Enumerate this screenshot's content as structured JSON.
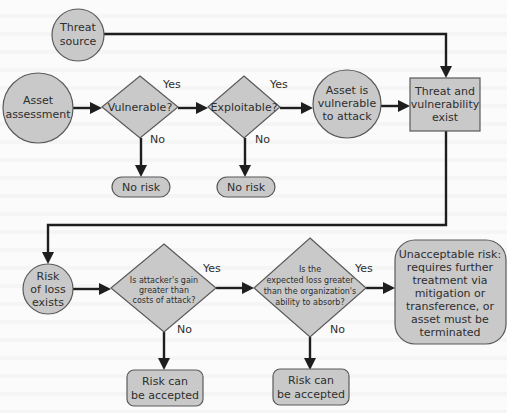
{
  "diagram": {
    "type": "flowchart",
    "nodes": {
      "threat_source": {
        "shape": "circle",
        "lines": [
          "Threat",
          "source"
        ]
      },
      "asset_assessment": {
        "shape": "circle",
        "lines": [
          "Asset",
          "assessment"
        ]
      },
      "vulnerable": {
        "shape": "diamond",
        "lines": [
          "Vulnerable?"
        ]
      },
      "exploitable": {
        "shape": "diamond",
        "lines": [
          "Exploitable?"
        ]
      },
      "no_risk_1": {
        "shape": "pill",
        "lines": [
          "No risk"
        ]
      },
      "no_risk_2": {
        "shape": "pill",
        "lines": [
          "No risk"
        ]
      },
      "asset_vulnerable": {
        "shape": "circle",
        "lines": [
          "Asset is",
          "vulnerable",
          "to attack"
        ]
      },
      "threat_vuln_exist": {
        "shape": "rect",
        "lines": [
          "Threat and",
          "vulnerability",
          "exist"
        ]
      },
      "risk_of_loss": {
        "shape": "circle",
        "lines": [
          "Risk",
          "of loss",
          "exists"
        ]
      },
      "attacker_gain": {
        "shape": "diamond",
        "lines": [
          "Is attacker's gain",
          "greater than",
          "costs of attack?"
        ]
      },
      "expected_loss": {
        "shape": "diamond",
        "lines": [
          "Is the",
          "expected loss greater",
          "than the organization's",
          "ability to absorb?"
        ]
      },
      "accept_1": {
        "shape": "rounded-rect",
        "lines": [
          "Risk can",
          "be accepted"
        ]
      },
      "accept_2": {
        "shape": "rounded-rect",
        "lines": [
          "Risk can",
          "be accepted"
        ]
      },
      "unacceptable": {
        "shape": "rounded-rect",
        "lines": [
          "Unacceptable risk:",
          "requires further",
          "treatment via",
          "mitigation or",
          "transference, or",
          "asset must be",
          "terminated"
        ]
      }
    },
    "edge_labels": {
      "yes": "Yes",
      "no": "No"
    },
    "edges": [
      {
        "from": "threat_source",
        "to": "threat_vuln_exist"
      },
      {
        "from": "asset_assessment",
        "to": "vulnerable"
      },
      {
        "from": "vulnerable",
        "to": "exploitable",
        "label": "Yes"
      },
      {
        "from": "vulnerable",
        "to": "no_risk_1",
        "label": "No"
      },
      {
        "from": "exploitable",
        "to": "asset_vulnerable",
        "label": "Yes"
      },
      {
        "from": "exploitable",
        "to": "no_risk_2",
        "label": "No"
      },
      {
        "from": "asset_vulnerable",
        "to": "threat_vuln_exist"
      },
      {
        "from": "threat_vuln_exist",
        "to": "risk_of_loss"
      },
      {
        "from": "risk_of_loss",
        "to": "attacker_gain"
      },
      {
        "from": "attacker_gain",
        "to": "expected_loss",
        "label": "Yes"
      },
      {
        "from": "attacker_gain",
        "to": "accept_1",
        "label": "No"
      },
      {
        "from": "expected_loss",
        "to": "unacceptable",
        "label": "Yes"
      },
      {
        "from": "expected_loss",
        "to": "accept_2",
        "label": "No"
      }
    ],
    "colors": {
      "shape_fill": "#c9c9c9",
      "shape_stroke": "#5a5a5a",
      "connector": "#1e1e1e",
      "text": "#2e2e2e",
      "background": "#fbfbfb"
    }
  }
}
